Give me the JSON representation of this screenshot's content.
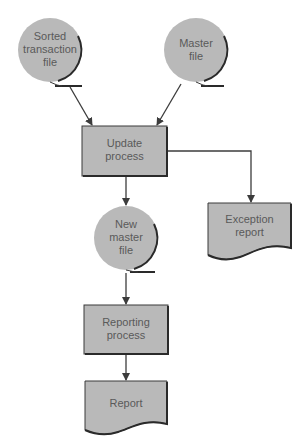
{
  "diagram": {
    "colors": {
      "fill": "#b9b9b9",
      "stroke": "#3a3a3a",
      "text": "#5a5a5a",
      "background": "#ffffff"
    },
    "nodes": [
      {
        "id": "sorted_transaction_file",
        "type": "magnetic-tape",
        "label": "Sorted\ntransaction\nfile"
      },
      {
        "id": "master_file",
        "type": "magnetic-tape",
        "label": "Master\nfile"
      },
      {
        "id": "update_process",
        "type": "process",
        "label": "Update\nprocess"
      },
      {
        "id": "new_master_file",
        "type": "magnetic-tape",
        "label": "New\nmaster\nfile"
      },
      {
        "id": "exception_report",
        "type": "document",
        "label": "Exception\nreport"
      },
      {
        "id": "reporting_process",
        "type": "process",
        "label": "Reporting\nprocess"
      },
      {
        "id": "report",
        "type": "document",
        "label": "Report"
      }
    ],
    "edges": [
      {
        "from": "sorted_transaction_file",
        "to": "update_process"
      },
      {
        "from": "master_file",
        "to": "update_process"
      },
      {
        "from": "update_process",
        "to": "new_master_file"
      },
      {
        "from": "update_process",
        "to": "exception_report"
      },
      {
        "from": "new_master_file",
        "to": "reporting_process"
      },
      {
        "from": "reporting_process",
        "to": "report"
      }
    ]
  },
  "labels": {
    "sorted_transaction_file": "Sorted\ntransaction\nfile",
    "master_file": "Master\nfile",
    "update_process": "Update\nprocess",
    "new_master_file": "New\nmaster\nfile",
    "exception_report": "Exception\nreport",
    "reporting_process": "Reporting\nprocess",
    "report": "Report"
  }
}
